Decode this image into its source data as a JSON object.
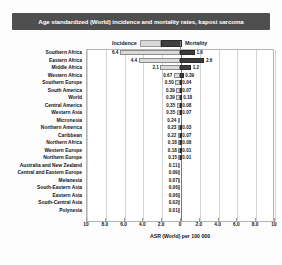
{
  "chart_data": {
    "type": "bar",
    "orientation": "horizontal-diverging",
    "title": "Age standardized (World) incidence and mortality rates, kaposi sarcoma",
    "xlabel": "ASR (World) per 100 000",
    "ylabel": "",
    "grid": true,
    "legend_position": "top-center",
    "xlim": [
      -10,
      10
    ],
    "xticks": [
      "10",
      "8.0",
      "6.0",
      "4.0",
      "2.0",
      "0",
      "2.0",
      "4.0",
      "6.0",
      "8.0",
      "10"
    ],
    "xtick_values": [
      -10,
      -8,
      -6,
      -4,
      -2,
      0,
      2,
      4,
      6,
      8,
      10
    ],
    "categories": [
      "Southern Africa",
      "Eastern Africa",
      "Middle Africa",
      "Western Africa",
      "Southern Europe",
      "South America",
      "World",
      "Central America",
      "Western Asia",
      "Micronesia",
      "Northern America",
      "Caribbean",
      "Northern  Africa",
      "Western  Europe",
      "Northern Europe",
      "Australia and New Zealand",
      "Central and Eastern Europe",
      "Melanesia",
      "South-Eastern Asia",
      "Eastern Asia",
      "South-Central Asia",
      "Polynesia"
    ],
    "series": [
      {
        "name": "Incidence",
        "side": "left",
        "color": "#d9d9d9",
        "values": [
          6.4,
          4.4,
          2.1,
          0.67,
          0.5,
          0.39,
          0.39,
          0.35,
          0.35,
          0.24,
          0.23,
          0.22,
          0.18,
          0.18,
          0.15,
          0.11,
          0.09,
          0.07,
          0.06,
          0.06,
          0.02,
          0.01
        ],
        "labels": [
          "6.4",
          "4.4",
          "2.1",
          "0.67",
          "0.50",
          "0.39",
          "0.39",
          "0.35",
          "0.35",
          "0.24",
          "0.23",
          "0.22",
          "0.18",
          "0.18",
          "0.15",
          "0.11",
          "0.09",
          "0.07",
          "0.06",
          "0.06",
          "0.02",
          "0.01"
        ]
      },
      {
        "name": "Mortality",
        "side": "right",
        "color": "#3d3d3d",
        "values": [
          1.6,
          2.6,
          1.2,
          0.39,
          0.04,
          0.07,
          0.18,
          0.08,
          0.07,
          0.0,
          0.03,
          0.07,
          0.08,
          0.01,
          0.01,
          0.0,
          0.0,
          0.0,
          0.0,
          0.0,
          0.0,
          0.0
        ],
        "labels": [
          "1.6",
          "2.6",
          "1.2",
          "0.39",
          "0.04",
          "0.07",
          "0.18",
          "0.08",
          "0.07",
          "",
          "0.03",
          "0.07",
          "0.08",
          "0.01",
          "0.01",
          "",
          "",
          "",
          "",
          "",
          "",
          ""
        ]
      }
    ]
  },
  "legend": {
    "incidence_label": "Incidence",
    "mortality_label": "Mortality",
    "incidence_color": "#d9d9d9",
    "mortality_color": "#3d3d3d"
  },
  "title_bar": {
    "text": "Age standardized (World) incidence and mortality rates, kaposi sarcoma",
    "background": "#4f4f4f",
    "text_color": "#ffffff"
  }
}
